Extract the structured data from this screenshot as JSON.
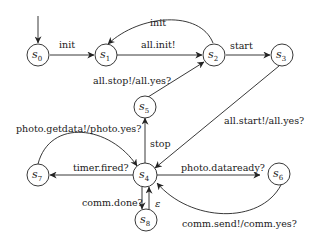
{
  "diagram": {
    "type": "state-machine",
    "initial_state": "s0",
    "states": [
      {
        "id": "s0",
        "base": "s",
        "sub": "0"
      },
      {
        "id": "s1",
        "base": "s",
        "sub": "1"
      },
      {
        "id": "s2",
        "base": "s",
        "sub": "2"
      },
      {
        "id": "s3",
        "base": "s",
        "sub": "3"
      },
      {
        "id": "s4",
        "base": "s",
        "sub": "4"
      },
      {
        "id": "s5",
        "base": "s",
        "sub": "5"
      },
      {
        "id": "s6",
        "base": "s",
        "sub": "6"
      },
      {
        "id": "s7",
        "base": "s",
        "sub": "7"
      },
      {
        "id": "s8",
        "base": "s",
        "sub": "8"
      }
    ],
    "transitions": [
      {
        "from": "s0",
        "to": "s1",
        "label": "init"
      },
      {
        "from": "s1",
        "to": "s2",
        "label": "all.init!"
      },
      {
        "from": "s2",
        "to": "s1",
        "label": "init"
      },
      {
        "from": "s2",
        "to": "s3",
        "label": "start"
      },
      {
        "from": "s5",
        "to": "s2",
        "label": "all.stop!/all.yes?"
      },
      {
        "from": "s3",
        "to": "s4",
        "label": "all.start!/all.yes?"
      },
      {
        "from": "s4",
        "to": "s5",
        "label": "stop"
      },
      {
        "from": "s7",
        "to": "s4",
        "label": "photo.getdata!/photo.yes?"
      },
      {
        "from": "s4",
        "to": "s7",
        "label": "timer.fired?"
      },
      {
        "from": "s4",
        "to": "s6",
        "label": "photo.dataready?"
      },
      {
        "from": "s6",
        "to": "s4",
        "label": "comm.send!/comm.yes?"
      },
      {
        "from": "s4",
        "to": "s8",
        "label": "comm.done?"
      },
      {
        "from": "s8",
        "to": "s4",
        "label": "ε"
      }
    ]
  }
}
